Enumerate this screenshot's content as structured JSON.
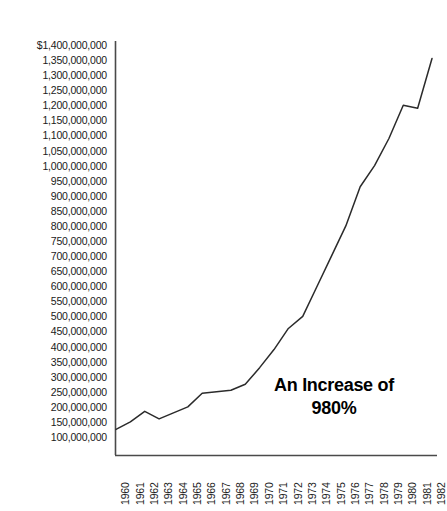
{
  "chart_data": {
    "type": "line",
    "title": "",
    "subtitle": "",
    "xlabel": "",
    "ylabel": "",
    "x": [
      1960,
      1961,
      1962,
      1963,
      1964,
      1965,
      1966,
      1967,
      1968,
      1969,
      1970,
      1971,
      1972,
      1973,
      1974,
      1975,
      1976,
      1977,
      1978,
      1979,
      1980,
      1981,
      1982
    ],
    "categories": [
      "1960",
      "1961",
      "1962",
      "1963",
      "1964",
      "1965",
      "1966",
      "1967",
      "1968",
      "1969",
      "1970",
      "1971",
      "1972",
      "1973",
      "1974",
      "1975",
      "1976",
      "1977",
      "1978",
      "1979",
      "1980",
      "1981",
      "1982"
    ],
    "values": [
      125000000,
      150000000,
      185000000,
      160000000,
      180000000,
      200000000,
      245000000,
      250000000,
      255000000,
      275000000,
      330000000,
      390000000,
      460000000,
      500000000,
      600000000,
      700000000,
      800000000,
      930000000,
      1000000000,
      1090000000,
      1200000000,
      1190000000,
      1355000000
    ],
    "series": [
      {
        "name": "Total",
        "values": [
          125000000,
          150000000,
          185000000,
          160000000,
          180000000,
          200000000,
          245000000,
          250000000,
          255000000,
          275000000,
          330000000,
          390000000,
          460000000,
          500000000,
          600000000,
          700000000,
          800000000,
          930000000,
          1000000000,
          1090000000,
          1200000000,
          1190000000,
          1355000000
        ]
      }
    ],
    "ylim": [
      100000000,
      1400000000
    ],
    "ytick_step": 50000000,
    "ytick_labels": [
      "$1,400,000,000",
      "1,350,000,000",
      "1,300,000,000",
      "1,250,000,000",
      "1,200,000,000",
      "1,150,000,000",
      "1,100,000,000",
      "1,050,000,000",
      "1,000,000,000",
      "950,000,000",
      "900,000,000",
      "850,000,000",
      "800,000,000",
      "750,000,000",
      "700,000,000",
      "650,000,000",
      "600,000,000",
      "550,000,000",
      "500,000,000",
      "450,000,000",
      "400,000,000",
      "350,000,000",
      "300,000,000",
      "250,000,000",
      "200,000,000",
      "150,000,000",
      "100,000,000"
    ],
    "ytick_values": [
      1400000000,
      1350000000,
      1300000000,
      1250000000,
      1200000000,
      1150000000,
      1100000000,
      1050000000,
      1000000000,
      950000000,
      900000000,
      850000000,
      800000000,
      750000000,
      700000000,
      650000000,
      600000000,
      550000000,
      500000000,
      450000000,
      400000000,
      350000000,
      300000000,
      250000000,
      200000000,
      150000000,
      100000000
    ],
    "grid": false,
    "legend": "none",
    "line_color": "#2b2b2b",
    "axis_color": "#4a4a4a",
    "background_color": "#ffffff",
    "annotations": [
      {
        "name": "increase-callout",
        "line1": "An Increase of",
        "line2": "980%"
      }
    ]
  }
}
